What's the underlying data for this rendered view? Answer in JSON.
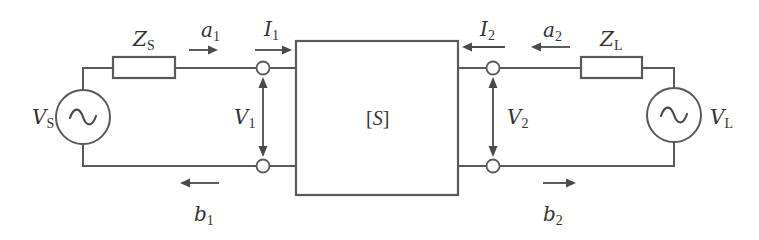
{
  "diagram": {
    "colors": {
      "line": "#5a5a5a",
      "arrow": "#4a4a4a",
      "text": "#333333",
      "background": "#ffffff"
    },
    "network": {
      "label_open": "[",
      "label_symbol": "S",
      "label_close": "]"
    },
    "source": {
      "symbol": "V",
      "sub": "S",
      "icon": "ac-source-icon"
    },
    "source_impedance": {
      "symbol": "Z",
      "sub": "S"
    },
    "load": {
      "symbol": "V",
      "sub": "L",
      "icon": "ac-source-icon"
    },
    "load_impedance": {
      "symbol": "Z",
      "sub": "L"
    },
    "port1": {
      "incident": {
        "symbol": "a",
        "sub": "1",
        "direction": "right"
      },
      "reflected": {
        "symbol": "b",
        "sub": "1",
        "direction": "left"
      },
      "current": {
        "symbol": "I",
        "sub": "1",
        "direction": "right"
      },
      "voltage": {
        "symbol": "V",
        "sub": "1"
      }
    },
    "port2": {
      "incident": {
        "symbol": "a",
        "sub": "2",
        "direction": "left"
      },
      "reflected": {
        "symbol": "b",
        "sub": "2",
        "direction": "right"
      },
      "current": {
        "symbol": "I",
        "sub": "2",
        "direction": "left"
      },
      "voltage": {
        "symbol": "V",
        "sub": "2"
      }
    }
  }
}
